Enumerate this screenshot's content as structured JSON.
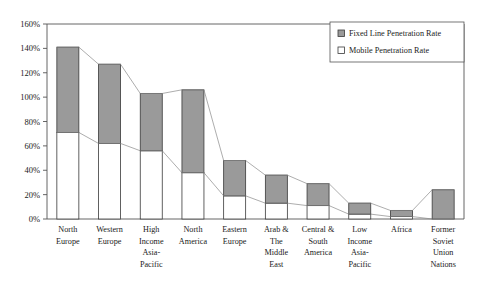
{
  "chart_data": {
    "type": "bar",
    "title": "",
    "subtitle": "",
    "xlabel": "",
    "ylabel": "",
    "stacked": true,
    "grid": false,
    "legend_position": "top-right",
    "ylim": [
      0,
      160
    ],
    "ytick_values": [
      0,
      20,
      40,
      60,
      80,
      100,
      120,
      140,
      160
    ],
    "ytick_labels": [
      "0%",
      "20%",
      "40%",
      "60%",
      "80%",
      "100%",
      "120%",
      "140%",
      "160%"
    ],
    "categories": [
      "North Europe",
      "Western Europe",
      "High Income Asia-Pacific",
      "North America",
      "Eastern Europe",
      "Arab & The Middle East",
      "Central & South America",
      "Low Income Asia-Pacific",
      "Africa",
      "Former Soviet Union Nations"
    ],
    "category_label_lines": [
      [
        "North",
        "Europe"
      ],
      [
        "Western",
        "Europe"
      ],
      [
        "High",
        "Income",
        "Asia-",
        "Pacific"
      ],
      [
        "North",
        "America"
      ],
      [
        "Eastern",
        "Europe"
      ],
      [
        "Arab &",
        "The",
        "Middle",
        "East"
      ],
      [
        "Central &",
        "South",
        "America"
      ],
      [
        "Low",
        "Income",
        "Asia-",
        "Pacific"
      ],
      [
        "Africa"
      ],
      [
        "Former",
        "Soviet",
        "Union",
        "Nations"
      ]
    ],
    "series": [
      {
        "name": "Mobile Penetration Rate",
        "color": "#ffffff",
        "values": [
          71,
          62,
          56,
          38,
          19,
          13,
          11,
          4,
          2,
          0
        ]
      },
      {
        "name": "Fixed Line Penetration Rate",
        "color": "#9a9a9a",
        "values": [
          70,
          65,
          47,
          68,
          29,
          23,
          18,
          9,
          5,
          24
        ]
      }
    ],
    "totals": [
      141,
      127,
      103,
      106,
      48,
      36,
      29,
      13,
      7,
      24
    ],
    "connector_lines": [
      {
        "name": "bar-top-connector",
        "values": [
          141,
          127,
          103,
          106,
          48,
          36,
          29,
          13,
          7,
          24
        ]
      },
      {
        "name": "mobile-top-connector",
        "values": [
          71,
          62,
          56,
          38,
          19,
          13,
          11,
          4,
          2,
          0
        ]
      }
    ]
  },
  "legend": {
    "items": [
      {
        "label": "Fixed Line Penetration Rate",
        "swatch": "filled"
      },
      {
        "label": "Mobile Penetration Rate",
        "swatch": "empty"
      }
    ]
  },
  "colors": {
    "fixed_line_fill": "#9a9a9a",
    "mobile_fill": "#ffffff",
    "bar_stroke": "#3a3a3a",
    "axis": "#555555",
    "connector": "#8a8a8a",
    "text": "#1a1a1a",
    "background": "#ffffff"
  }
}
